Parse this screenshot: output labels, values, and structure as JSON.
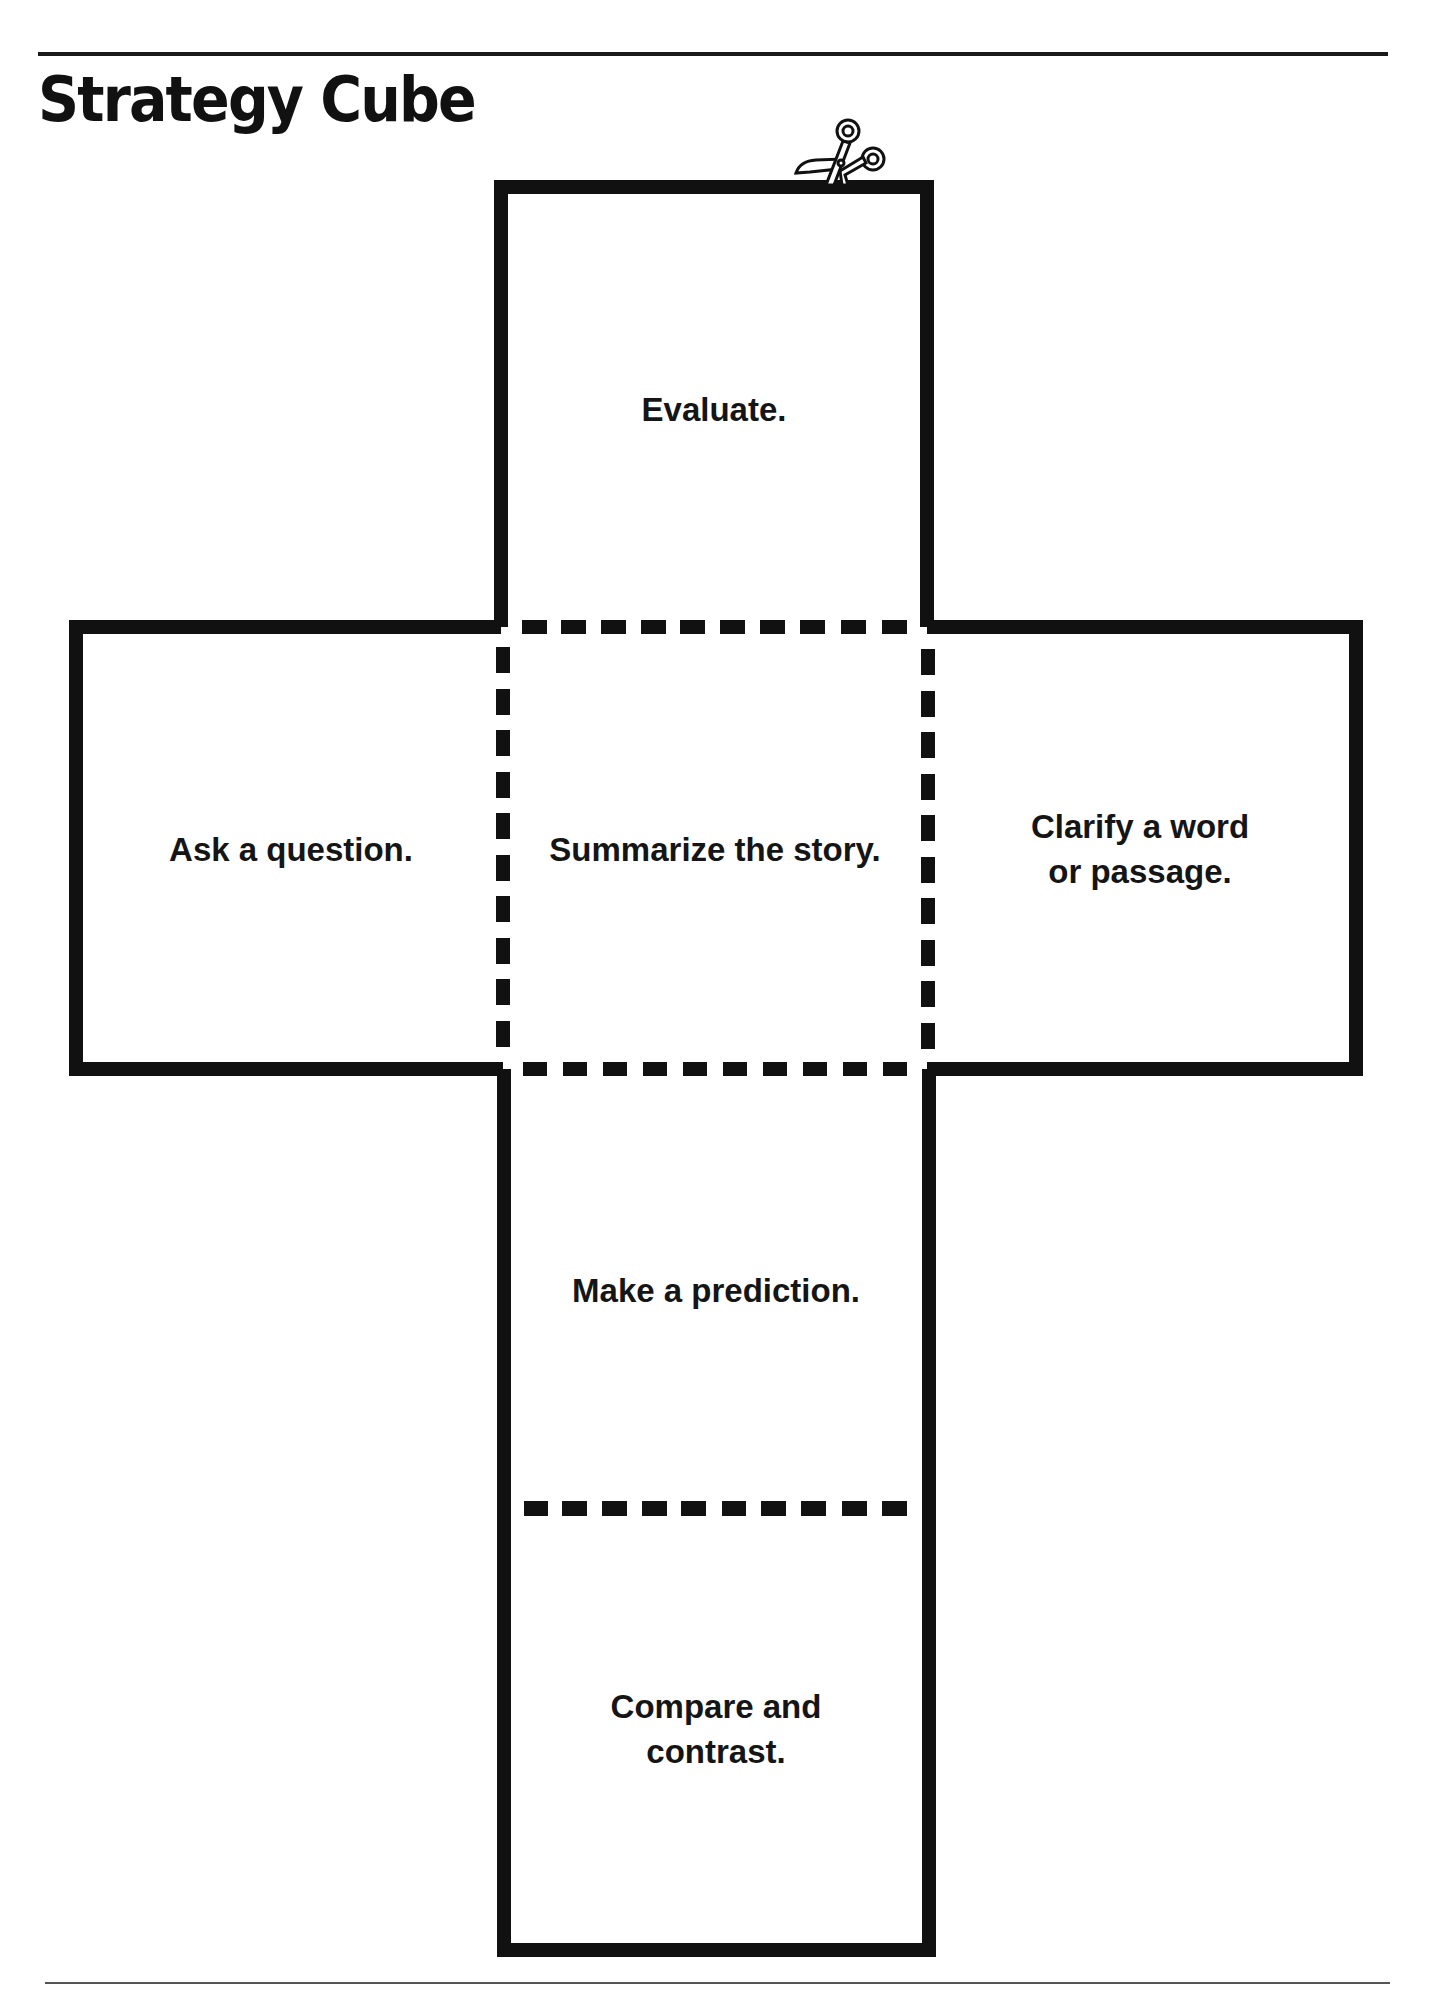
{
  "page": {
    "title": "Strategy Cube"
  },
  "cube_net": {
    "faces": {
      "top": "Evaluate.",
      "left": "Ask a question.",
      "center": "Summarize the story.",
      "right_line1": "Clarify a word",
      "right_line2": "or passage.",
      "lower": "Make a prediction.",
      "bottom_line1": "Compare and",
      "bottom_line2": "contrast."
    },
    "icons": {
      "cut_marker": "scissors-icon"
    },
    "colors": {
      "line": "#111111",
      "background": "#ffffff"
    }
  }
}
